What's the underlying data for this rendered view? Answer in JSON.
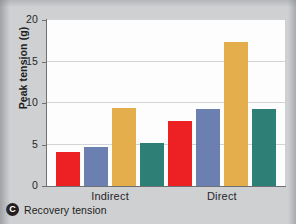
{
  "panel": {
    "badge_letter": "C",
    "caption": "Recovery tension"
  },
  "colors": {
    "series_red": "#ED2024",
    "series_blue": "#6B7FB0",
    "series_gold": "#E3AE4B",
    "series_teal": "#2E8076",
    "plot_background": "#FDFDFD",
    "figure_background": "#CFD0D2",
    "axis": "#6F7073",
    "gridline": "#D2D3D5"
  },
  "chart_data": {
    "type": "bar",
    "title": "Recovery tension",
    "xlabel": "",
    "ylabel": "Peak tension (g)",
    "categories": [
      "Indirect",
      "Direct"
    ],
    "ylim": [
      0,
      20
    ],
    "yticks": [
      0,
      5,
      10,
      15,
      20
    ],
    "ytick_labels": [
      "0",
      "5",
      "10",
      "15",
      "20"
    ],
    "grid": true,
    "legend": "none",
    "series": [
      {
        "name": "Series 1",
        "color": "#ED2024",
        "values": [
          4.1,
          7.8
        ]
      },
      {
        "name": "Series 2",
        "color": "#6B7FB0",
        "values": [
          4.7,
          9.3
        ]
      },
      {
        "name": "Series 3",
        "color": "#E3AE4B",
        "values": [
          9.4,
          17.3
        ]
      },
      {
        "name": "Series 4",
        "color": "#2E8076",
        "values": [
          5.2,
          9.3
        ]
      }
    ]
  }
}
